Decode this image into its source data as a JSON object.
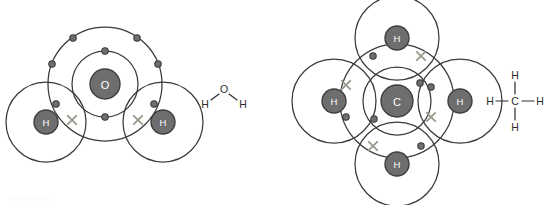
{
  "page": {
    "background": "#ffffff",
    "width": 552,
    "height": 205
  },
  "palette": {
    "nucleus_fill": "#6e6e6e",
    "nucleus_stroke": "#3f3f3f",
    "shell_stroke": "#3a3a3a",
    "electron_dot_fill": "#6f6f6f",
    "electron_cross_stroke": "#9b9b8f",
    "label_text": "#ffffff",
    "formula_text": "#2b2b2b"
  },
  "diagrams": [
    {
      "id": "water",
      "name": "water-molecule-diagram",
      "formula": "H2O",
      "center": {
        "x": 105,
        "y": 84
      },
      "central_atom": {
        "symbol": "O",
        "name": "oxygen",
        "nucleus_radius": 15,
        "shells": [
          {
            "radius": 33,
            "electrons_shown": 2
          },
          {
            "radius": 57,
            "electrons_shown": 6
          }
        ]
      },
      "bonded_atoms": [
        {
          "symbol": "H",
          "name": "hydrogen-left",
          "cx": 46,
          "cy": 122,
          "shell_radius": 40,
          "nucleus_radius": 12
        },
        {
          "symbol": "H",
          "name": "hydrogen-right",
          "cx": 163,
          "cy": 122,
          "shell_radius": 40,
          "nucleus_radius": 12
        }
      ],
      "inner_shell_dots": [
        {
          "x": 105,
          "y": 51
        },
        {
          "x": 105,
          "y": 117
        }
      ],
      "outer_shell_dots": [
        {
          "x": 73,
          "y": 38
        },
        {
          "x": 137,
          "y": 38
        },
        {
          "x": 52,
          "y": 64
        },
        {
          "x": 158,
          "y": 64
        },
        {
          "x": 56,
          "y": 104
        },
        {
          "x": 154,
          "y": 104
        }
      ],
      "bond_crosses": [
        {
          "x": 72,
          "y": 120
        },
        {
          "x": 138,
          "y": 120
        }
      ],
      "structural_formula": {
        "name": "water-structural-formula",
        "atoms": [
          {
            "symbol": "O",
            "x": 224,
            "y": 89
          },
          {
            "symbol": "H",
            "x": 205,
            "y": 104
          },
          {
            "symbol": "H",
            "x": 243,
            "y": 104
          }
        ],
        "bonds": [
          {
            "x1": 211,
            "y1": 100,
            "x2": 219,
            "y2": 94
          },
          {
            "x1": 229,
            "y1": 94,
            "x2": 237,
            "y2": 100
          }
        ]
      }
    },
    {
      "id": "methane",
      "name": "methane-molecule-diagram",
      "formula": "CH4",
      "center": {
        "x": 397,
        "y": 101
      },
      "central_atom": {
        "symbol": "C",
        "name": "carbon",
        "nucleus_radius": 16,
        "shells": [
          {
            "radius": 34,
            "electrons_shown": 2
          },
          {
            "radius": 57,
            "electrons_shown": 4
          }
        ]
      },
      "bonded_atoms": [
        {
          "symbol": "H",
          "name": "hydrogen-top",
          "cx": 397,
          "cy": 38,
          "shell_radius": 42,
          "nucleus_radius": 12
        },
        {
          "symbol": "H",
          "name": "hydrogen-bottom",
          "cx": 397,
          "cy": 164,
          "shell_radius": 42,
          "nucleus_radius": 12
        },
        {
          "symbol": "H",
          "name": "hydrogen-left",
          "cx": 334,
          "cy": 101,
          "shell_radius": 42,
          "nucleus_radius": 12
        },
        {
          "symbol": "H",
          "name": "hydrogen-right",
          "cx": 460,
          "cy": 101,
          "shell_radius": 42,
          "nucleus_radius": 12
        }
      ],
      "inner_shell_dots": [
        {
          "x": 420,
          "y": 83
        },
        {
          "x": 374,
          "y": 119
        }
      ],
      "outer_shell_dots": [
        {
          "x": 373,
          "y": 56
        },
        {
          "x": 421,
          "y": 146
        },
        {
          "x": 346,
          "y": 117
        },
        {
          "x": 431,
          "y": 87
        }
      ],
      "bond_crosses": [
        {
          "x": 421,
          "y": 56
        },
        {
          "x": 373,
          "y": 146
        },
        {
          "x": 346,
          "y": 85
        },
        {
          "x": 431,
          "y": 117
        }
      ],
      "structural_formula": {
        "name": "methane-structural-formula",
        "atoms": [
          {
            "symbol": "C",
            "x": 515,
            "y": 101
          },
          {
            "symbol": "H",
            "x": 515,
            "y": 75
          },
          {
            "symbol": "H",
            "x": 515,
            "y": 127
          },
          {
            "symbol": "H",
            "x": 490,
            "y": 101
          },
          {
            "symbol": "H",
            "x": 540,
            "y": 101
          }
        ],
        "bonds": [
          {
            "x1": 515,
            "y1": 82,
            "x2": 515,
            "y2": 94
          },
          {
            "x1": 515,
            "y1": 108,
            "x2": 515,
            "y2": 120
          },
          {
            "x1": 496,
            "y1": 101,
            "x2": 508,
            "y2": 101
          },
          {
            "x1": 522,
            "y1": 101,
            "x2": 534,
            "y2": 101
          }
        ]
      }
    }
  ]
}
